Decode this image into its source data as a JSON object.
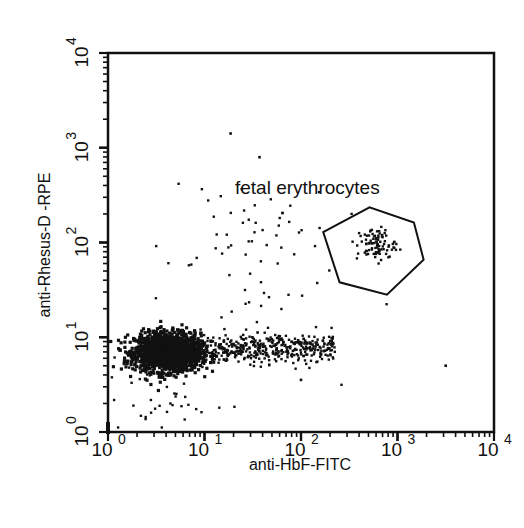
{
  "chart_data": {
    "type": "scatter",
    "title": "",
    "xlabel": "anti-HbF-FITC",
    "ylabel": "anti-Rhesus-D -RPE",
    "xscale": "log",
    "yscale": "log",
    "xlim": [
      1,
      10000
    ],
    "ylim": [
      1,
      10000
    ],
    "grid": false,
    "x_ticks": [
      {
        "base": "10",
        "exp": "0",
        "value": 1
      },
      {
        "base": "10",
        "exp": "1",
        "value": 10
      },
      {
        "base": "10",
        "exp": "2",
        "value": 100
      },
      {
        "base": "10",
        "exp": "3",
        "value": 1000
      },
      {
        "base": "10",
        "exp": "4",
        "value": 10000
      }
    ],
    "y_ticks": [
      {
        "base": "10",
        "exp": "0",
        "value": 1
      },
      {
        "base": "10",
        "exp": "1",
        "value": 10
      },
      {
        "base": "10",
        "exp": "2",
        "value": 100
      },
      {
        "base": "10",
        "exp": "3",
        "value": 1000
      },
      {
        "base": "10",
        "exp": "4",
        "value": 10000
      }
    ],
    "gate": {
      "label": "fetal erythrocytes",
      "shape": "polygon",
      "vertices_log10": [
        [
          2.23,
          2.11
        ],
        [
          2.71,
          2.37
        ],
        [
          3.17,
          2.21
        ],
        [
          3.27,
          1.82
        ],
        [
          2.89,
          1.45
        ],
        [
          2.4,
          1.58
        ]
      ]
    },
    "populations": [
      {
        "name": "maternal erythrocytes (Rh-D neg, HbF neg)",
        "center_log10": [
          0.62,
          0.84
        ],
        "spread_log10": [
          0.17,
          0.1
        ],
        "count": 1700,
        "density": "very high"
      },
      {
        "name": "HbF low tail",
        "center_log10": [
          1.45,
          0.88
        ],
        "spread_log10": [
          0.45,
          0.08
        ],
        "count": 420,
        "density": "medium"
      },
      {
        "name": "fetal erythrocytes (Rh-D pos, HbF pos)",
        "center_log10": [
          2.78,
          1.98
        ],
        "spread_log10": [
          0.1,
          0.09
        ],
        "count": 90,
        "density": "medium"
      },
      {
        "name": "low scatter debris",
        "center_log10": [
          0.45,
          0.35
        ],
        "spread_log10": [
          0.25,
          0.22
        ],
        "count": 45,
        "density": "low"
      },
      {
        "name": "sparse outliers",
        "center_log10": [
          1.4,
          1.9
        ],
        "spread_log10": [
          0.45,
          0.55
        ],
        "count": 70,
        "density": "low"
      }
    ],
    "notable_points_log10": [
      [
        1.27,
        3.15
      ],
      [
        1.57,
        2.9
      ],
      [
        3.5,
        0.7
      ],
      [
        2.0,
        0.55
      ],
      [
        1.55,
        1.05
      ]
    ]
  },
  "axes": {
    "x_title": "anti-HbF-FITC",
    "y_title": "anti-Rhesus-D -RPE"
  },
  "annotation": {
    "gate_label": "fetal erythrocytes"
  },
  "colors": {
    "ink": "#111111",
    "background": "#ffffff"
  }
}
